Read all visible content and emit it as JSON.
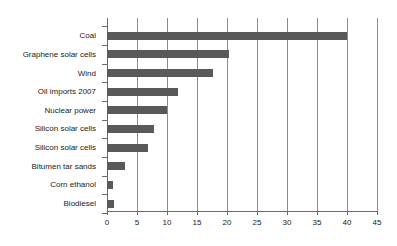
{
  "chart_data": {
    "type": "bar",
    "orientation": "horizontal",
    "title": "",
    "subtitle": "",
    "xlabel": "",
    "ylabel": "",
    "categories": [
      "Coal",
      "Graphene solar cells",
      "Wind",
      "Oil imports 2007",
      "Nuclear power",
      "Silicon solar cells",
      "Silicon solar cells",
      "Bitumen tar sands",
      "Corn ethanol",
      "Biodiesel"
    ],
    "values": [
      40,
      20.3,
      17.7,
      11.8,
      10,
      7.9,
      6.8,
      3,
      1,
      1.2
    ],
    "xlim": [
      0,
      45
    ],
    "xticks": [
      0,
      5,
      10,
      15,
      20,
      25,
      30,
      35,
      40,
      45
    ],
    "xtick_labels": [
      "0",
      "5",
      "10",
      "15",
      "20",
      "25",
      "30",
      "35",
      "40",
      "45"
    ],
    "grid": "vertical",
    "legend": "none",
    "bar_color": "#595959",
    "grid_color": "#8c8c8c",
    "axis_color": "#6b6b6b",
    "background_color": "#ffffff"
  }
}
